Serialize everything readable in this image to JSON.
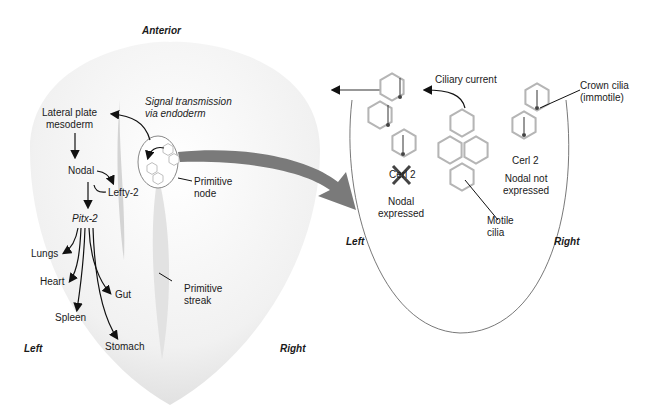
{
  "embryo": {
    "anterior": "Anterior",
    "left": "Left",
    "right": "Right",
    "signal_transmission_line1": "Signal transmission",
    "signal_transmission_line2": "via endoderm",
    "lateral_plate_line1": "Lateral plate",
    "lateral_plate_line2": "mesoderm",
    "nodal": "Nodal",
    "lefty2": "Lefty-2",
    "pitx2": "Pitx-2",
    "organs": [
      "Lungs",
      "Heart",
      "Spleen",
      "Gut",
      "Stomach"
    ],
    "primitive_node_line1": "Primitive",
    "primitive_node_line2": "node",
    "primitive_streak_line1": "Primitive",
    "primitive_streak_line2": "streak"
  },
  "node_detail": {
    "ciliary_current": "Ciliary current",
    "crown_cilia_line1": "Crown cilia",
    "crown_cilia_line2": "(immotile)",
    "cerl2_left": "Cerl 2",
    "nodal_expressed_line1": "Nodal",
    "nodal_expressed_line2": "expressed",
    "cerl2_right": "Cerl 2",
    "nodal_not_line1": "Nodal not",
    "nodal_not_line2": "expressed",
    "motile_line1": "Motile",
    "motile_line2": "cilia",
    "left": "Left",
    "right": "Right"
  },
  "colors": {
    "hex_outline": "#b5b5b5",
    "big_arrow": "#7a7a7a",
    "embryo_fill": "#eeeeee"
  }
}
